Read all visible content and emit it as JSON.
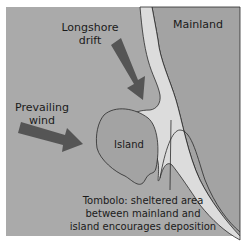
{
  "diagram": {
    "labels": {
      "mainland": "Mainland",
      "longshore_line1": "Longshore",
      "longshore_line2": "drift",
      "prevailing_line1": "Prevailing",
      "prevailing_line2": "wind",
      "island": "Island",
      "tombolo_line1": "Tombolo: sheltered area",
      "tombolo_line2": "between mainland and",
      "tombolo_line3": "island encourages deposition"
    },
    "arrows": [
      {
        "name": "longshore-drift-arrow",
        "direction": "down-right"
      },
      {
        "name": "prevailing-wind-arrow",
        "direction": "right"
      }
    ],
    "colors": {
      "sea": "#aaaaaa",
      "land": "#a3a3a3",
      "beach": "#dcdcdc",
      "arrow": "#555555",
      "outline": "#2a2a2a"
    }
  }
}
